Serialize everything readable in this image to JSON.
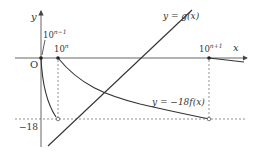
{
  "figure": {
    "axes": {
      "x_label": "x",
      "y_label": "y",
      "origin_label": "O"
    },
    "x_ticks": [
      {
        "base": "10",
        "exponent": "n−1"
      },
      {
        "base": "10",
        "exponent": "n"
      },
      {
        "base": "10",
        "exponent": "n+1"
      }
    ],
    "y_ticks": [
      {
        "label": "−18"
      }
    ],
    "curves": {
      "g_label": "y = g(x)",
      "f_label": "y = −18f(x)"
    },
    "colors": {
      "curve": "#333333",
      "axis": "#555555",
      "dashed": "#666666"
    }
  }
}
